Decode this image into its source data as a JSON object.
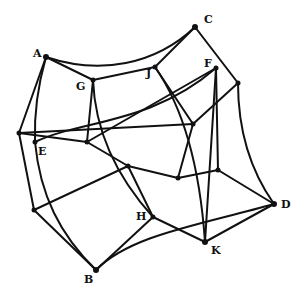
{
  "diagram": {
    "type": "graph-polyhedron",
    "colors": {
      "stroke": "#111111",
      "background": "#ffffff"
    },
    "labels": [
      {
        "id": "A",
        "text": "A",
        "x": 33,
        "y": 57
      },
      {
        "id": "C",
        "text": "C",
        "x": 204,
        "y": 23
      },
      {
        "id": "G",
        "text": "G",
        "x": 76,
        "y": 90
      },
      {
        "id": "J",
        "text": "J",
        "x": 146,
        "y": 77
      },
      {
        "id": "F",
        "text": "F",
        "x": 204,
        "y": 67
      },
      {
        "id": "E",
        "text": "E",
        "x": 38,
        "y": 155
      },
      {
        "id": "H",
        "text": "H",
        "x": 136,
        "y": 220
      },
      {
        "id": "D",
        "text": "D",
        "x": 281,
        "y": 208
      },
      {
        "id": "K",
        "text": "K",
        "x": 211,
        "y": 254
      },
      {
        "id": "B",
        "text": "B",
        "x": 84,
        "y": 283
      }
    ]
  }
}
